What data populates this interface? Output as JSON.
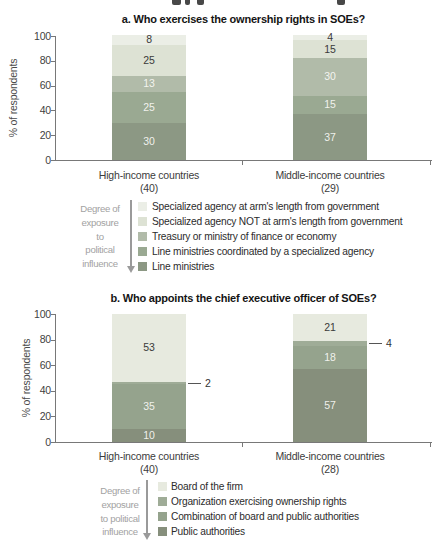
{
  "chart_data": [
    {
      "type": "bar",
      "stacked": true,
      "title": "a. Who exercises the ownership rights in SOEs?",
      "ylabel": "% of respondents",
      "ylim": [
        0,
        100
      ],
      "yticks": [
        0,
        20,
        40,
        60,
        80,
        100
      ],
      "grid": false,
      "legend_position": "bottom",
      "categories": [
        {
          "label": "High-income countries",
          "n": "(40)"
        },
        {
          "label": "Middle-income countries",
          "n": "(29)"
        }
      ],
      "series": [
        {
          "name": "Specialized agency at arm's length from government",
          "values": [
            8,
            4
          ],
          "color": "#ebeee6"
        },
        {
          "name": "Specialized agency NOT at arm's length from government",
          "values": [
            25,
            15
          ],
          "color": "#dde2d4"
        },
        {
          "name": "Treasury or ministry of finance or economy",
          "values": [
            13,
            30
          ],
          "color": "#b1bba9"
        },
        {
          "name": "Line ministries coordinated by a specialized agency",
          "values": [
            25,
            15
          ],
          "color": "#9aa992"
        },
        {
          "name": "Line ministries",
          "values": [
            30,
            37
          ],
          "color": "#8c9884"
        }
      ],
      "exposure_label_lines": [
        "Degree of",
        "exposure",
        "to",
        "political",
        "influence"
      ]
    },
    {
      "type": "bar",
      "stacked": true,
      "title": "b. Who appoints the chief executive officer of SOEs?",
      "ylabel": "% of respondents",
      "ylim": [
        0,
        100
      ],
      "yticks": [
        0,
        20,
        40,
        60,
        80,
        100
      ],
      "grid": false,
      "legend_position": "bottom",
      "categories": [
        {
          "label": "High-income countries",
          "n": "(40)"
        },
        {
          "label": "Middle-income countries",
          "n": "(28)"
        }
      ],
      "series": [
        {
          "name": "Board of the firm",
          "values": [
            53,
            21
          ],
          "color": "#e7eadf"
        },
        {
          "name": "Organization exercising ownership rights",
          "values": [
            2,
            4
          ],
          "color": "#9fac97",
          "callout": true
        },
        {
          "name": "Combination of board and public authorities",
          "values": [
            35,
            18
          ],
          "color": "#95a38d"
        },
        {
          "name": "Public authorities",
          "values": [
            10,
            57
          ],
          "color": "#868f7c"
        }
      ],
      "exposure_label_lines": [
        "Degree of",
        "exposure",
        "to political",
        "influence"
      ]
    }
  ]
}
